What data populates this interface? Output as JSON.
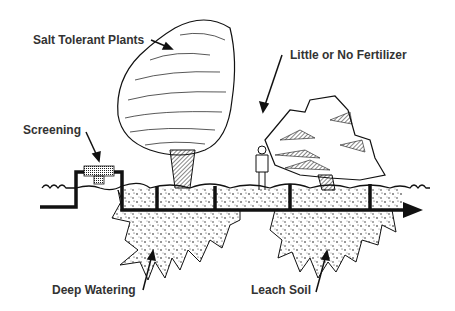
{
  "diagram": {
    "labels": {
      "salt_tolerant_plants": "Salt Tolerant Plants",
      "little_or_no_fertilizer": "Little or No Fertilizer",
      "screening": "Screening",
      "deep_watering": "Deep Watering",
      "leach_soil": "Leach Soil"
    },
    "colors": {
      "ink": "#111111",
      "text": "#333333",
      "background": "#ffffff"
    }
  }
}
